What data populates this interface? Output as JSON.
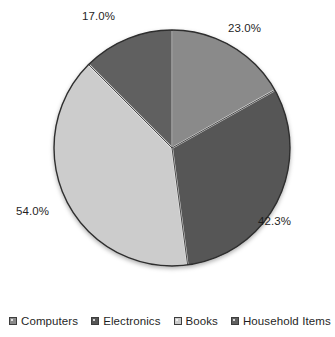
{
  "chart_data": {
    "type": "pie",
    "title": "",
    "subtitle": "",
    "xlabel": "",
    "ylabel": "",
    "legend_position": "bottom",
    "grid": false,
    "label_format": "percent",
    "labels_sum_percent": 136.3,
    "start_angle_deg": 0,
    "direction": "clockwise",
    "categories": [
      "Computers",
      "Electronics",
      "Books",
      "Household Items"
    ],
    "values": [
      23.0,
      42.3,
      54.0,
      17.0
    ],
    "slices": [
      {
        "label": "Computers",
        "value": 23.0,
        "display": "23.0%",
        "color": "#8a8a8a",
        "start_deg": 0.0,
        "end_deg": 60.7,
        "label_x": 228,
        "label_y": 22
      },
      {
        "label": "Electronics",
        "value": 42.3,
        "display": "42.3%",
        "color": "#565656",
        "start_deg": 60.7,
        "end_deg": 172.4,
        "label_x": 258,
        "label_y": 215
      },
      {
        "label": "Books",
        "value": 54.0,
        "display": "54.0%",
        "color": "#cccccc",
        "start_deg": 172.4,
        "end_deg": 315.0,
        "label_x": 16,
        "label_y": 205
      },
      {
        "label": "Household Items",
        "value": 17.0,
        "display": "17.0%",
        "color": "#606060",
        "start_deg": 315.0,
        "end_deg": 360.0,
        "label_x": 82,
        "label_y": 10
      }
    ]
  },
  "legend": {
    "items": [
      {
        "label": "Computers",
        "color": "#8a8a8a"
      },
      {
        "label": "Electronics",
        "color": "#565656"
      },
      {
        "label": "Books",
        "color": "#cccccc"
      },
      {
        "label": "Household Items",
        "color": "#606060"
      }
    ]
  },
  "geometry": {
    "center_x": 172,
    "center_y": 148,
    "radius": 118,
    "outline_color": "#2e2e2e"
  }
}
